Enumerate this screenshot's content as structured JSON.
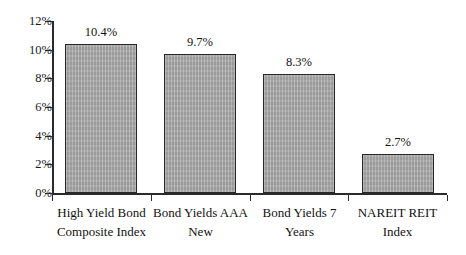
{
  "chart_data": {
    "type": "bar",
    "title": "",
    "subtitle": "",
    "xlabel": "",
    "ylabel": "",
    "categories": [
      "High Yield Bond Composite Index",
      "Bond Yields AAA New",
      "Bond Yields 7 Years",
      "NAREIT REIT Index"
    ],
    "category_lines": [
      [
        "High Yield Bond",
        "Composite Index"
      ],
      [
        "Bond Yields AAA",
        "New"
      ],
      [
        "Bond Yields 7",
        "Years"
      ],
      [
        "NAREIT REIT",
        "Index"
      ]
    ],
    "values": [
      10.4,
      9.7,
      8.3,
      2.7
    ],
    "value_labels": [
      "10.4%",
      "9.7%",
      "8.3%",
      "2.7%"
    ],
    "ylim": [
      0,
      12
    ],
    "ytick_values": [
      0,
      2,
      4,
      6,
      8,
      10,
      12
    ],
    "ytick_labels": [
      "0%",
      "2%",
      "4%",
      "6%",
      "8%",
      "10%",
      "12%"
    ],
    "grid": false,
    "legend": false,
    "legend_position": "none",
    "bar_fill_color": "#a9a9a9",
    "bar_border_color": "#262626",
    "axis_color": "#2b2b2b",
    "background_color": "#ffffff"
  }
}
